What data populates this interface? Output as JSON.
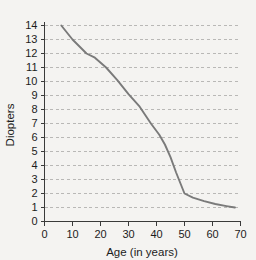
{
  "chart_data": {
    "type": "line",
    "title": "",
    "xlabel": "Age (in years)",
    "ylabel": "Diopters",
    "xlim": [
      0,
      70
    ],
    "ylim": [
      0,
      14
    ],
    "grid": true,
    "grid_axis": "y",
    "legend": false,
    "legend_position": "none",
    "xticks": [
      0,
      10,
      20,
      30,
      40,
      50,
      60,
      70
    ],
    "xtick_labels": [
      "0",
      "10",
      "20",
      "30",
      "40",
      "50",
      "60",
      "70"
    ],
    "yticks": [
      0,
      1,
      2,
      3,
      4,
      5,
      6,
      7,
      8,
      9,
      10,
      11,
      12,
      13,
      14
    ],
    "ytick_labels": [
      "0",
      "1",
      "2",
      "3",
      "4",
      "5",
      "6",
      "7",
      "8",
      "9",
      "10",
      "11",
      "12",
      "13",
      "14"
    ],
    "series": [
      {
        "name": "Accommodation amplitude",
        "color": "#7a7a7a",
        "x": [
          6,
          10,
          15,
          18,
          22,
          26,
          30,
          34,
          38,
          41,
          43,
          45,
          47,
          50,
          53,
          57,
          61,
          65,
          68
        ],
        "y": [
          14.0,
          13.0,
          12.0,
          11.7,
          11.0,
          10.1,
          9.1,
          8.2,
          7.0,
          6.2,
          5.5,
          4.6,
          3.5,
          2.0,
          1.7,
          1.45,
          1.25,
          1.1,
          1.0
        ]
      }
    ],
    "annotations": []
  },
  "colors": {
    "background": "#f4f3f1",
    "axis": "#3a3a3a",
    "grid": "#b9b8b6",
    "series": "#7a7a7a",
    "text": "#1c1c1c"
  }
}
